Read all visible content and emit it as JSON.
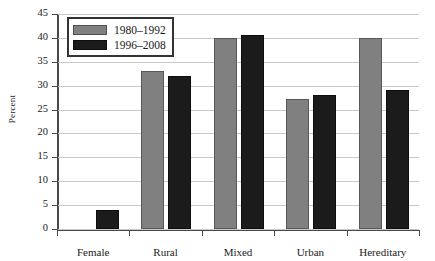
{
  "chart_data": {
    "type": "bar",
    "title": "",
    "xlabel": "",
    "ylabel": "Percent",
    "ylim": [
      0,
      45
    ],
    "ytick_step": 5,
    "yticks": [
      45,
      40,
      35,
      30,
      25,
      20,
      15,
      10,
      5,
      0
    ],
    "grid": true,
    "legend_position": "top-left",
    "categories": [
      "Female",
      "Rural",
      "Mixed",
      "Urban",
      "Hereditary"
    ],
    "series": [
      {
        "name": "1980–1992",
        "color": "#808080",
        "values": [
          0,
          33,
          40,
          27.3,
          40
        ]
      },
      {
        "name": "1996–2008",
        "color": "#1b1b1b",
        "values": [
          4,
          32,
          40.6,
          28,
          29
        ]
      }
    ]
  },
  "colors": {
    "series_1980_1992": "#808080",
    "series_1996_2008": "#1b1b1b",
    "gridline": "#c9c9c9",
    "axis": "#4a4a4a",
    "background": "#ffffff"
  }
}
